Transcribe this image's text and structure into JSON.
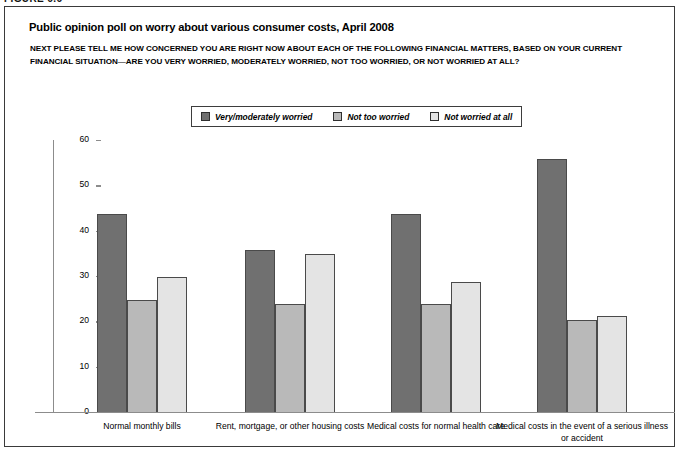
{
  "figure": {
    "label": "FIGURE 6.6"
  },
  "title": "Public opinion poll on worry about various consumer costs, April 2008",
  "subtitle": "NEXT PLEASE TELL ME HOW CONCERNED YOU ARE RIGHT NOW ABOUT EACH OF THE FOLLOWING FINANCIAL MATTERS, BASED ON YOUR CURRENT FINANCIAL SITUATION—ARE YOU VERY WORRIED, MODERATELY WORRIED, NOT TOO WORRIED, OR NOT WORRIED AT ALL?",
  "colors": {
    "series_dark": "#707070",
    "series_medium": "#b9b9b9",
    "series_light": "#e4e4e4",
    "bar_outline": "#4a4a4a",
    "axis": "#8c8c8c",
    "border": "#3a3a3a"
  },
  "chart_data": {
    "type": "bar",
    "title": "Public opinion poll on worry about various consumer costs, April 2008",
    "xlabel": "",
    "ylabel": "",
    "ylim": [
      0,
      60
    ],
    "yticks": [
      0,
      10,
      20,
      30,
      40,
      50,
      60
    ],
    "grid": false,
    "legend_position": "top-center",
    "categories": [
      "Normal monthly bills",
      "Rent, mortgage, or other housing costs",
      "Medical costs for normal health care",
      "Medical costs in the event of a serious illness or accident"
    ],
    "series": [
      {
        "name": "Very/moderately worried",
        "color": "#707070",
        "values": [
          44,
          36,
          44,
          56
        ]
      },
      {
        "name": "Not too worried",
        "color": "#b9b9b9",
        "values": [
          25,
          24,
          24,
          20.5
        ]
      },
      {
        "name": "Not worried at all",
        "color": "#e4e4e4",
        "values": [
          30,
          35,
          29,
          21.5
        ]
      }
    ]
  }
}
